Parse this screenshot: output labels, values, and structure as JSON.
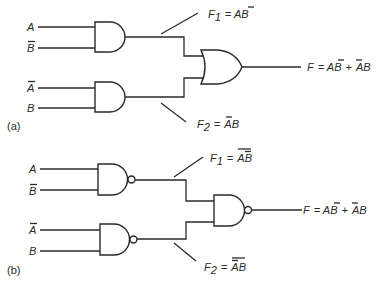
{
  "diagram": {
    "type": "logic-circuit",
    "parts": [
      {
        "caption": "(a)",
        "gates": [
          {
            "id": "g1",
            "type": "AND",
            "inputs": [
              "A",
              "B̄"
            ],
            "output": "F1"
          },
          {
            "id": "g2",
            "type": "AND",
            "inputs": [
              "Ā",
              "B"
            ],
            "output": "F2"
          },
          {
            "id": "g3",
            "type": "OR",
            "inputs": [
              "F1",
              "F2"
            ],
            "output": "F"
          }
        ],
        "inputs": [
          "A",
          "B̄",
          "Ā",
          "B"
        ],
        "f1_label": {
          "name": "F",
          "sub": "1",
          "eq": " = A",
          "bar": "B",
          "overall_bar": false
        },
        "f2_label": {
          "name": "F",
          "sub": "2",
          "eq": " = ",
          "bar": "A",
          "rest": "B",
          "overall_bar": false
        },
        "output_label": "F = AB̄ + ĀB"
      },
      {
        "caption": "(b)",
        "gates": [
          {
            "id": "g1",
            "type": "NAND",
            "inputs": [
              "A",
              "B̄"
            ],
            "output": "F1"
          },
          {
            "id": "g2",
            "type": "NAND",
            "inputs": [
              "Ā",
              "B"
            ],
            "output": "F2"
          },
          {
            "id": "g3",
            "type": "NAND",
            "inputs": [
              "F1",
              "F2"
            ],
            "output": "F"
          }
        ],
        "inputs": [
          "A",
          "B̄",
          "Ā",
          "B"
        ],
        "f1_label": {
          "name": "F",
          "sub": "1",
          "eq": " = ",
          "expr": "AB̄",
          "overall_bar": true
        },
        "f2_label": {
          "name": "F",
          "sub": "2",
          "eq": " = ",
          "expr": "ĀB",
          "overall_bar": true
        },
        "output_label": "F = AB̄ + ĀB"
      }
    ]
  },
  "labels": {
    "a": {
      "caption": "(a)",
      "in1": "A",
      "in2": "B",
      "in3": "A",
      "in4": "B",
      "f1_name": "F",
      "f1_sub": "1",
      "f1_eq": "= A",
      "f1_b": "B",
      "f2_name": "F",
      "f2_sub": "2",
      "f2_eq": "=",
      "f2_a": "A",
      "f2_b": "B",
      "out_f": "F",
      "out_eq": "= A",
      "out_b1": "B",
      "out_plus": "+",
      "out_a2": "A",
      "out_b2": "B"
    },
    "b": {
      "caption": "(b)",
      "in1": "A",
      "in2": "B",
      "in3": "A",
      "in4": "B",
      "f1_name": "F",
      "f1_sub": "1",
      "f1_eq": "=",
      "f1_a": "A",
      "f1_b": "B",
      "f2_name": "F",
      "f2_sub": "2",
      "f2_eq": "=",
      "f2_a": "A",
      "f2_b": "B",
      "out_f": "F",
      "out_eq": "= A",
      "out_b1": "B",
      "out_plus": "+",
      "out_a2": "A",
      "out_b2": "B"
    }
  }
}
